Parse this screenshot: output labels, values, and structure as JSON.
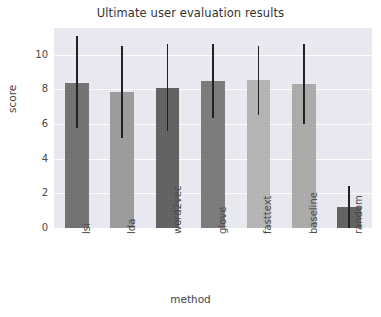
{
  "chart_data": {
    "type": "bar",
    "title": "Ultimate user evaluation results",
    "xlabel": "method",
    "ylabel": "score",
    "categories": [
      "lsi",
      "lda",
      "word2vec",
      "glove",
      "fasttext",
      "baseline",
      "random"
    ],
    "values": [
      8.35,
      7.85,
      8.1,
      8.5,
      8.55,
      8.3,
      1.2
    ],
    "errors_low": [
      5.75,
      5.2,
      5.6,
      6.35,
      6.55,
      6.0,
      0.0
    ],
    "errors_high": [
      11.1,
      10.5,
      10.65,
      10.6,
      10.5,
      10.65,
      2.45
    ],
    "bar_colors": [
      "#6f6f6f",
      "#9a9a9a",
      "#5e5e5e",
      "#787878",
      "#b4b4b4",
      "#aaaaaa",
      "#5f5f5f"
    ],
    "errorbar_color": "#1a1a1a",
    "ylim": [
      0,
      11.55
    ],
    "yticks": [
      0,
      2,
      4,
      6,
      8,
      10
    ],
    "ytick_labels": [
      "0",
      "2",
      "4",
      "6",
      "8",
      "10"
    ],
    "grid": true,
    "grid_color": "#ffffff",
    "plot_background": "#eaeaf2",
    "legend": null
  },
  "axes": {
    "y_tick_0": "0",
    "y_tick_1": "2",
    "y_tick_2": "4",
    "y_tick_3": "6",
    "y_tick_4": "8",
    "y_tick_5": "10",
    "x_tick_0": "lsi",
    "x_tick_1": "lda",
    "x_tick_2": "word2vec",
    "x_tick_3": "glove",
    "x_tick_4": "fasttext",
    "x_tick_5": "baseline",
    "x_tick_6": "random"
  }
}
